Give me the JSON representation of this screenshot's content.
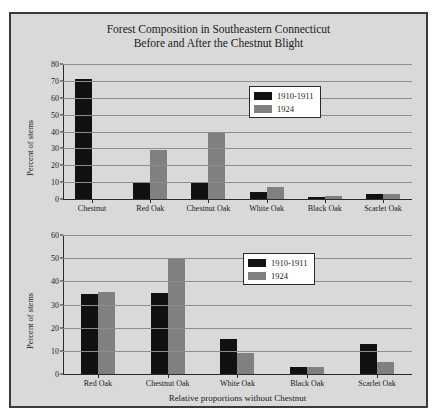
{
  "figure": {
    "title_line1": "Forest Composition in Southeastern Connecticut",
    "title_line2": "Before and After the Chestnut Blight",
    "colors": {
      "series_1910": "#111111",
      "series_1924": "#808080",
      "background": "#d9d9d9",
      "border": "#3a3a3a"
    }
  },
  "chart_data": [
    {
      "type": "bar",
      "title": "Forest Composition in Southeastern Connecticut Before and After the Chestnut Blight",
      "panel": "top",
      "categories": [
        "Chestnut",
        "Red Oak",
        "Chestnut Oak",
        "White Oak",
        "Black Oak",
        "Scarlet Oak"
      ],
      "series": [
        {
          "name": "1910-1911",
          "color": "#111111",
          "values": [
            71,
            10,
            10,
            4,
            1,
            3
          ]
        },
        {
          "name": "1924",
          "color": "#808080",
          "values": [
            0,
            29,
            40,
            7,
            2,
            3
          ]
        }
      ],
      "xlabel": "",
      "ylabel": "Percent of stems",
      "ylim": [
        0,
        80
      ],
      "yticks": [
        0,
        10,
        20,
        30,
        40,
        50,
        60,
        70,
        80
      ],
      "grid": true,
      "legend_position": "upper right"
    },
    {
      "type": "bar",
      "panel": "bottom",
      "categories": [
        "Red Oak",
        "Chestnut Oak",
        "White Oak",
        "Black Oak",
        "Scarlet Oak"
      ],
      "series": [
        {
          "name": "1910-1911",
          "color": "#111111",
          "values": [
            34.5,
            35,
            15,
            3,
            13
          ]
        },
        {
          "name": "1924",
          "color": "#808080",
          "values": [
            35.5,
            49.5,
            9,
            3,
            5
          ]
        }
      ],
      "xlabel": "Relative proportions without Chestnut",
      "ylabel": "Percent of stems",
      "ylim": [
        0,
        60
      ],
      "yticks": [
        0,
        10,
        20,
        30,
        40,
        50,
        60
      ],
      "grid": true,
      "legend_position": "upper right"
    }
  ]
}
